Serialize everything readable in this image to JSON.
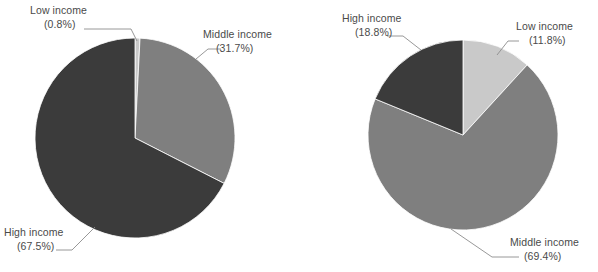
{
  "figure": {
    "background_color": "#ffffff",
    "label_color": "#4a4a4a",
    "leader_color": "#8c8c8c"
  },
  "palette": {
    "low_income": "#c9c9c9",
    "middle_income": "#7f7f7f",
    "high_income": "#3b3b3b"
  },
  "chart_data": [
    {
      "type": "pie",
      "id": "left-pie",
      "title": "",
      "categories": [
        "Low income",
        "Middle income",
        "High income"
      ],
      "values": [
        0.8,
        31.7,
        67.5
      ],
      "value_unit": "%",
      "colors": [
        "#c9c9c9",
        "#7f7f7f",
        "#3b3b3b"
      ],
      "start_angle_deg": -90,
      "direction": "clockwise",
      "legend": "callout-labels",
      "grid": false,
      "center": {
        "x": 135,
        "y": 138
      },
      "radius": 100,
      "slices": [
        {
          "name": "Low income",
          "value": 0.8,
          "label": "Low income",
          "value_label": "(0.8%)",
          "color": "#c9c9c9"
        },
        {
          "name": "Middle income",
          "value": 31.7,
          "label": "Middle income",
          "value_label": "(31.7%)",
          "color": "#7f7f7f"
        },
        {
          "name": "High income",
          "value": 67.5,
          "label": "High income",
          "value_label": "(67.5%)",
          "color": "#3b3b3b"
        }
      ]
    },
    {
      "type": "pie",
      "id": "right-pie",
      "title": "",
      "categories": [
        "Low income",
        "Middle income",
        "High income"
      ],
      "values": [
        11.8,
        69.4,
        18.8
      ],
      "value_unit": "%",
      "colors": [
        "#c9c9c9",
        "#7f7f7f",
        "#3b3b3b"
      ],
      "start_angle_deg": -90,
      "direction": "clockwise",
      "legend": "callout-labels",
      "grid": false,
      "center": {
        "x": 463,
        "y": 135
      },
      "radius": 95,
      "slices": [
        {
          "name": "Low income",
          "value": 11.8,
          "label": "Low income",
          "value_label": "(11.8%)",
          "color": "#c9c9c9"
        },
        {
          "name": "Middle income",
          "value": 69.4,
          "label": "Middle income",
          "value_label": "(69.4%)",
          "color": "#7f7f7f"
        },
        {
          "name": "High income",
          "value": 18.8,
          "label": "High income",
          "value_label": "(18.8%)",
          "color": "#3b3b3b"
        }
      ]
    }
  ],
  "labels": {
    "left": {
      "low_income_name": "Low income",
      "low_income_value": "(0.8%)",
      "middle_income_name": "Middle income",
      "middle_income_value": "(31.7%)",
      "high_income_name": "High income",
      "high_income_value": "(67.5%)"
    },
    "right": {
      "high_income_name": "High income",
      "high_income_value": "(18.8%)",
      "low_income_name": "Low income",
      "low_income_value": "(11.8%)",
      "middle_income_name": "Middle income",
      "middle_income_value": "(69.4%)"
    }
  }
}
